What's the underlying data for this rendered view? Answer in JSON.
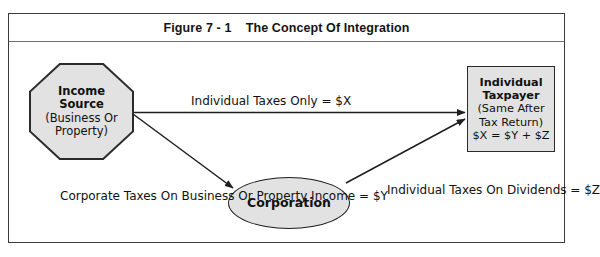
{
  "figure": {
    "title": "Figure 7 - 1    The Concept Of Integration",
    "title_number": "Figure 7 - 1",
    "title_name": "The Concept Of Integration"
  },
  "nodes": {
    "income_source": {
      "shape": "octagon",
      "lines": [
        "Income",
        "Source",
        "(Business Or",
        "Property)"
      ]
    },
    "corporation": {
      "shape": "ellipse",
      "lines": [
        "Corporation"
      ]
    },
    "individual_taxpayer": {
      "shape": "rectangle",
      "lines": [
        "Individual",
        "Taxpayer",
        "(Same After",
        "Tax Return)",
        "$X = $Y + $Z"
      ]
    }
  },
  "labels": {
    "individual_taxes_only": [
      "Individual Taxes Only = $X"
    ],
    "corporate_taxes": [
      "Corporate Taxes On",
      "Business Or Property",
      "Income = $Y"
    ],
    "individual_taxes_dividends": [
      "Individual Taxes",
      "On Dividends = $Z"
    ]
  },
  "edges": [
    {
      "name": "income-source-to-individual-taxpayer",
      "from": "income_source",
      "to": "individual_taxpayer",
      "label": "individual_taxes_only"
    },
    {
      "name": "income-source-to-corporation",
      "from": "income_source",
      "to": "corporation",
      "label": "corporate_taxes"
    },
    {
      "name": "corporation-to-individual-taxpayer",
      "from": "corporation",
      "to": "individual_taxpayer",
      "label": "individual_taxes_dividends"
    }
  ],
  "colors": {
    "shape_fill": "#e2e2e2",
    "shape_stroke": "#2b2b2b",
    "frame_stroke": "#3a3a3a",
    "title_rule": "#6f6f6f",
    "text": "#111111",
    "background": "#ffffff"
  }
}
